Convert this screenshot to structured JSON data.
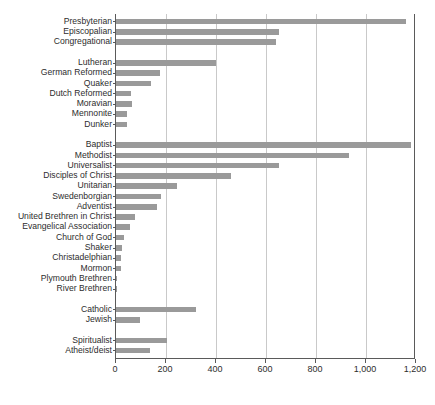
{
  "chart_data": {
    "type": "bar",
    "orientation": "horizontal",
    "title": "",
    "subtitle": "",
    "xlabel": "",
    "ylabel": "",
    "xlim": [
      0,
      1200
    ],
    "grid": true,
    "legend": null,
    "bar_color": "#9a9a9a",
    "axis_color": "#5a5a5a",
    "gridline_color": "#c9c9c9",
    "xticks": [
      0,
      200,
      400,
      600,
      800,
      1000,
      1200
    ],
    "xtick_labels": [
      "0",
      "200",
      "400",
      "600",
      "800",
      "1,000",
      "1,200"
    ],
    "categories": [
      "Presbyterian",
      "Episcopalian",
      "Congregational",
      "Lutheran",
      "German Reformed",
      "Quaker",
      "Dutch Reformed",
      "Moravian",
      "Mennonite",
      "Dunker",
      "Baptist",
      "Methodist",
      "Universalist",
      "Disciples of Christ",
      "Unitarian",
      "Swedenborgian",
      "Adventist",
      "United Brethren in Christ",
      "Evangelical Association",
      "Church of God",
      "Shaker",
      "Christadelphian",
      "Mormon",
      "Plymouth Brethren",
      "River Brethren",
      "Catholic",
      "Jewish",
      "Spiritualist",
      "Atheist/deist"
    ],
    "values": [
      1160,
      650,
      640,
      400,
      175,
      140,
      60,
      65,
      45,
      45,
      1180,
      930,
      650,
      460,
      245,
      180,
      165,
      75,
      55,
      30,
      25,
      20,
      20,
      5,
      3,
      320,
      95,
      205,
      135
    ],
    "group_breaks_after": [
      2,
      9,
      24,
      26
    ],
    "groups": [
      {
        "name": "",
        "categories": [
          "Presbyterian",
          "Episcopalian",
          "Congregational"
        ]
      },
      {
        "name": "",
        "categories": [
          "Lutheran",
          "German Reformed",
          "Quaker",
          "Dutch Reformed",
          "Moravian",
          "Mennonite",
          "Dunker"
        ]
      },
      {
        "name": "",
        "categories": [
          "Baptist",
          "Methodist",
          "Universalist",
          "Disciples of Christ",
          "Unitarian",
          "Swedenborgian",
          "Adventist",
          "United Brethren in Christ",
          "Evangelical Association",
          "Church of God",
          "Shaker",
          "Christadelphian",
          "Mormon",
          "Plymouth Brethren",
          "River Brethren"
        ]
      },
      {
        "name": "",
        "categories": [
          "Catholic",
          "Jewish"
        ]
      },
      {
        "name": "",
        "categories": [
          "Spiritualist",
          "Atheist/deist"
        ]
      }
    ]
  }
}
